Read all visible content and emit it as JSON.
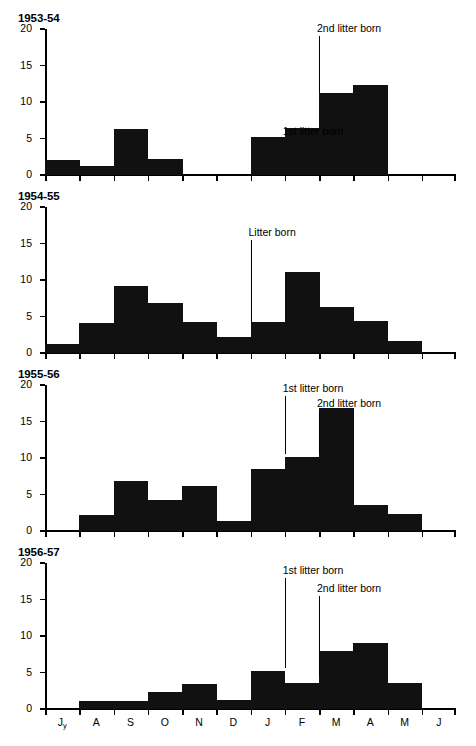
{
  "figure": {
    "axis": {
      "y_ticks": [
        0,
        5,
        10,
        15,
        20
      ],
      "y_tick_labels": [
        "0",
        "5",
        "10",
        "15",
        "20"
      ],
      "ylim": [
        0,
        20
      ],
      "x_tick_labels": [
        "Jy",
        "A",
        "S",
        "O",
        "N",
        "D",
        "J",
        "F",
        "M",
        "A",
        "M",
        "J"
      ],
      "grid": false
    },
    "ink_color": "#111111"
  },
  "chart_data": [
    {
      "type": "bar",
      "title": "1953-54",
      "xlabel": "",
      "ylabel": "",
      "ylim": [
        0,
        20
      ],
      "categories": [
        "Jy",
        "A",
        "S",
        "O",
        "N",
        "D",
        "J",
        "F",
        "M",
        "A",
        "M",
        "J"
      ],
      "values": [
        2.1,
        1.3,
        6.3,
        2.2,
        0,
        0,
        5.2,
        6.4,
        11.3,
        12.3,
        0,
        0
      ],
      "annotations": [
        {
          "label": "1st litter born",
          "category": "F",
          "line_top": 5,
          "line_bottom": 6.4
        },
        {
          "label": "2nd litter born",
          "category": "M",
          "line_top": 19,
          "line_bottom": 11.3
        }
      ]
    },
    {
      "type": "bar",
      "title": "1954-55",
      "xlabel": "",
      "ylabel": "",
      "ylim": [
        0,
        20
      ],
      "categories": [
        "Jy",
        "A",
        "S",
        "O",
        "N",
        "D",
        "J",
        "F",
        "M",
        "A",
        "M",
        "J"
      ],
      "values": [
        1.2,
        4.1,
        9.2,
        6.9,
        4.3,
        2.2,
        4.3,
        11.1,
        6.3,
        4.4,
        1.6,
        0
      ],
      "annotations": [
        {
          "label": "Litter born",
          "category": "J",
          "line_top": 15.5,
          "line_bottom": 4.3
        }
      ]
    },
    {
      "type": "bar",
      "title": "1955-56",
      "xlabel": "",
      "ylabel": "",
      "ylim": [
        0,
        20
      ],
      "categories": [
        "Jy",
        "A",
        "S",
        "O",
        "N",
        "D",
        "J",
        "F",
        "M",
        "A",
        "M",
        "J"
      ],
      "values": [
        0,
        2.2,
        6.8,
        4.3,
        6.1,
        1.4,
        8.5,
        10.2,
        16.9,
        3.6,
        2.3,
        0
      ],
      "annotations": [
        {
          "label": "1st litter born",
          "category": "F",
          "line_top": 18.5,
          "line_bottom": 10.6
        },
        {
          "label": "2nd litter born",
          "category": "M",
          "line_top": 16.5,
          "line_bottom": 10.6
        }
      ]
    },
    {
      "type": "bar",
      "title": "1956-57",
      "xlabel": "",
      "ylabel": "",
      "ylim": [
        0,
        20
      ],
      "categories": [
        "Jy",
        "A",
        "S",
        "O",
        "N",
        "D",
        "J",
        "F",
        "M",
        "A",
        "M",
        "J"
      ],
      "values": [
        0,
        1.1,
        1.1,
        2.3,
        3.4,
        1.3,
        5.2,
        3.5,
        8.0,
        9.1,
        3.6,
        0
      ],
      "annotations": [
        {
          "label": "1st litter born",
          "category": "F",
          "line_top": 18,
          "line_bottom": 5.6
        },
        {
          "label": "2nd litter born",
          "category": "M",
          "line_top": 15.5,
          "line_bottom": 4.5
        }
      ]
    }
  ]
}
